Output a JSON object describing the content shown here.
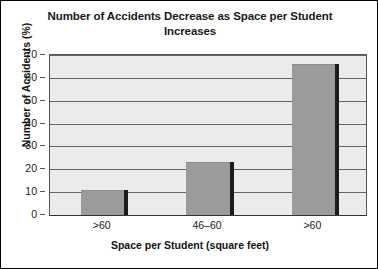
{
  "chart_data": {
    "type": "bar",
    "title": "Number of Accidents Decrease as Space per Student Increases",
    "xlabel": "Space per Student (square feet)",
    "ylabel": "Number of Accidents (%)",
    "categories": [
      ">60",
      "46–60",
      ">60"
    ],
    "values": [
      11,
      23,
      66
    ],
    "ylim": [
      0,
      70
    ],
    "ytick_labels": [
      "0",
      "10",
      "20",
      "30",
      "40",
      "50",
      "60",
      "70"
    ],
    "ytick_values": [
      0,
      10,
      20,
      30,
      40,
      50,
      60,
      70
    ],
    "grid": true,
    "legend": "none",
    "colors": {
      "bar_fill": "#9b9b9b",
      "bar_shadow": "#1c1c1c",
      "plot_background": "#ebebeb",
      "gridline": "#666666",
      "text": "#1a1a1a",
      "frame": "#000000"
    }
  }
}
